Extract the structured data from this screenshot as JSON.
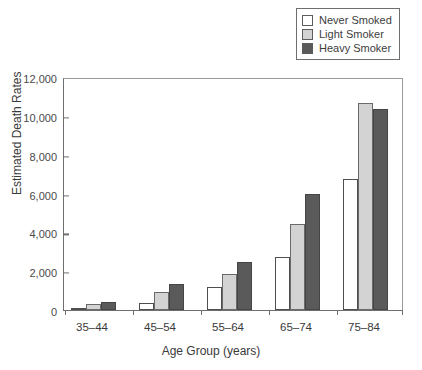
{
  "chart_data": {
    "type": "bar",
    "title": "",
    "xlabel": "Age Group (years)",
    "ylabel": "Estimated Death Rates",
    "categories": [
      "35–44",
      "45–54",
      "55–64",
      "65–74",
      "75–84"
    ],
    "series": [
      {
        "name": "Never Smoked",
        "color": "#ffffff",
        "values": [
          50,
          350,
          1180,
          2750,
          6750
        ]
      },
      {
        "name": "Light Smoker",
        "color": "#d3d3d3",
        "values": [
          300,
          950,
          1850,
          4450,
          10650
        ]
      },
      {
        "name": "Heavy Smoker",
        "color": "#5a5a5a",
        "values": [
          430,
          1350,
          2450,
          5950,
          10350
        ]
      }
    ],
    "ylim": [
      0,
      12000
    ],
    "ytick_values": [
      0,
      2000,
      4000,
      6000,
      8000,
      10000,
      12000
    ],
    "ytick_labels": [
      "0",
      "2,000",
      "4,000",
      "6,000",
      "8,000",
      "10,000",
      "12,000"
    ],
    "grid": false,
    "legend_position": "top-right"
  },
  "legend": {
    "items": [
      {
        "label": "Never Smoked",
        "swatch": "#ffffff"
      },
      {
        "label": "Light Smoker",
        "swatch": "#d3d3d3"
      },
      {
        "label": "Heavy Smoker",
        "swatch": "#5a5a5a"
      }
    ]
  }
}
